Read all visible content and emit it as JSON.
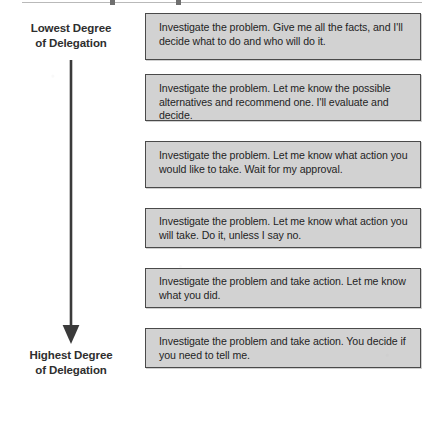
{
  "diagram": {
    "axis": {
      "top_label": "Lowest Degree\nof Delegation",
      "bottom_label": "Highest Degree\nof Delegation",
      "arrow_direction": "down",
      "arrow_icon": "down-arrow-icon",
      "arrow_color": "#3a3a3a"
    },
    "box_style": {
      "fill": "#d2d2d2",
      "border": "#4a4a4a",
      "text_color": "#242424"
    },
    "statements": [
      {
        "index": 1,
        "text": "Investigate the problem. Give me all the facts, and I'll decide what to do and who will do it."
      },
      {
        "index": 2,
        "text": "Investigate the problem. Let me know the possible alternatives and recommend one. I'll evaluate and decide."
      },
      {
        "index": 3,
        "text": "Investigate the problem. Let me know what action you would like to take. Wait for my approval."
      },
      {
        "index": 4,
        "text": "Investigate the problem. Let me know what action you will take. Do it, unless I say no."
      },
      {
        "index": 5,
        "text": "Investigate the problem and take action. Let me know what you did."
      },
      {
        "index": 6,
        "text": "Investigate the problem and take action. You decide if you need to tell me."
      }
    ]
  }
}
